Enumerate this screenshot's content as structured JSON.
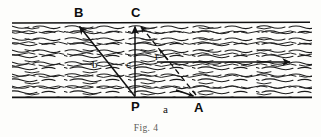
{
  "figure": {
    "caption": "Fig. 4",
    "colors": {
      "ink": "#111111",
      "hatch": "#1a1a1a",
      "paper": "#fdfdfb",
      "caption": "#5a5a56"
    },
    "band": {
      "x_left": 12,
      "x_right": 312,
      "y_top": 23,
      "y_bottom": 97,
      "fill_pattern": "wavy-horizontal-dashes"
    },
    "points": [
      {
        "id": "B",
        "label": "B",
        "x": 78,
        "y": 23,
        "label_x": 74,
        "label_y": 16
      },
      {
        "id": "C",
        "label": "C",
        "x": 135,
        "y": 23,
        "label_x": 131,
        "label_y": 16
      },
      {
        "id": "P",
        "label": "P",
        "x": 135,
        "y": 97,
        "label_x": 131,
        "label_y": 110
      },
      {
        "id": "A",
        "label": "A",
        "x": 197,
        "y": 97,
        "label_x": 195,
        "label_y": 111
      }
    ],
    "segment_labels": [
      {
        "id": "b",
        "label": "b",
        "x": 95,
        "y": 65
      },
      {
        "id": "c",
        "label": "c",
        "x": 128,
        "y": 65
      },
      {
        "id": "a",
        "label": "a",
        "x": 166,
        "y": 110
      },
      {
        "id": "r",
        "label": "r",
        "x": 157,
        "y": 57
      }
    ],
    "vectors": [
      {
        "id": "PB",
        "label": "b",
        "from": "P",
        "to": "B",
        "style": "solid",
        "arrowhead": "end"
      },
      {
        "id": "PC",
        "label": "c",
        "from": "P",
        "to": "C",
        "style": "solid",
        "arrowhead": "end"
      },
      {
        "id": "AC",
        "label": "r",
        "from": "A",
        "to": "C",
        "style": "dashed",
        "arrowhead": "both"
      },
      {
        "id": "flow",
        "label": "",
        "from": "mid-left",
        "to": "mid-right",
        "style": "solid",
        "arrowhead": "end"
      }
    ]
  }
}
